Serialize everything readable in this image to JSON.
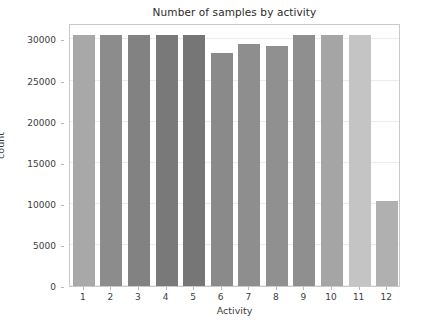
{
  "chart_data": {
    "type": "bar",
    "title": "Number of samples by activity",
    "xlabel": "Activity",
    "ylabel": "count",
    "categories": [
      "1",
      "2",
      "3",
      "4",
      "5",
      "6",
      "7",
      "8",
      "9",
      "10",
      "11",
      "12"
    ],
    "values": [
      30600,
      30600,
      30600,
      30600,
      30600,
      28300,
      29500,
      29250,
      30600,
      30600,
      30600,
      10300
    ],
    "bar_colors": [
      "#a8a8a8",
      "#8c8c8c",
      "#828282",
      "#797979",
      "#767676",
      "#8a8a8a",
      "#8e8e8e",
      "#909090",
      "#8f8f8f",
      "#a5a5a5",
      "#c4c4c4",
      "#b0b0b0"
    ],
    "ylim": [
      0,
      32000
    ],
    "yticks": [
      0,
      5000,
      10000,
      15000,
      20000,
      25000,
      30000
    ],
    "ytick_labels": [
      "0",
      "5000",
      "10000",
      "15000",
      "20000",
      "25000",
      "30000"
    ],
    "xtick_labels": [
      "1",
      "2",
      "3",
      "4",
      "5",
      "6",
      "7",
      "8",
      "9",
      "10",
      "11",
      "12"
    ],
    "grid": true,
    "grid_axis": "y",
    "grid_color": "#ececec",
    "legend": null,
    "background_color": "#ffffff",
    "axes_border_color": "#c9c9c9",
    "tick_label_color": "#3c3c3c",
    "title_color": "#2b2b2b"
  }
}
